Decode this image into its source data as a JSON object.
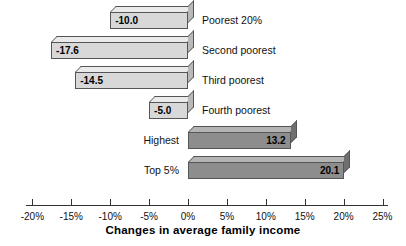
{
  "chart_data": {
    "type": "bar",
    "orientation": "horizontal",
    "title": "",
    "xlabel": "Changes in average family income",
    "ylabel": "",
    "categories": [
      "Poorest 20%",
      "Second poorest",
      "Third poorest",
      "Fourth poorest",
      "Highest",
      "Top 5%"
    ],
    "values": [
      -10.0,
      -17.6,
      -14.5,
      -5.0,
      13.2,
      20.1
    ],
    "value_labels": [
      "-10.0",
      "-17.6",
      "-14.5",
      "-5.0",
      "13.2",
      "20.1"
    ],
    "xlim": [
      -20,
      25
    ],
    "xticks": [
      -20,
      -15,
      -10,
      -5,
      0,
      5,
      10,
      15,
      20,
      25
    ],
    "xtick_labels": [
      "-20%",
      "-15%",
      "-10%",
      "-5%",
      "0%",
      "5%",
      "10%",
      "15%",
      "20%",
      "25%"
    ],
    "grid": false,
    "legend": null,
    "colors": {
      "negative_bar": "#d8d8d8",
      "positive_bar": "#8d8d8d",
      "bar_outline": "#555555",
      "axis": "#333333",
      "text": "#111111",
      "background": "#ffffff"
    }
  }
}
